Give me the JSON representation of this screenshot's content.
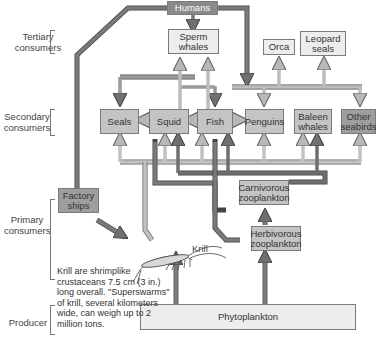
{
  "levels": {
    "tertiary": "Tertiary consumers",
    "secondary": "Secondary consumers",
    "primary": "Primary consumers",
    "producer": "Producer"
  },
  "nodes": {
    "humans": "Humans",
    "sperm_whales": "Sperm whales",
    "orca": "Orca",
    "leopard_seals": "Leopard seals",
    "seals": "Seals",
    "squid": "Squid",
    "fish": "Fish",
    "penguins": "Penguins",
    "baleen_whales": "Baleen whales",
    "other_seabirds": "Other seabirds",
    "factory_ships": "Factory ships",
    "carnivorous_zooplankton": "Carnivorous zooplankton",
    "herbivorous_zooplankton": "Herbivorous zooplankton",
    "krill": "Krill",
    "phytoplankton": "Phytoplankton"
  },
  "note": "Krill are shrimplike crustaceans 7.5 cm (3 in.) long overall. \"Superswarms\" of krill, several kilometers wide, can weigh up to 2 million tons.",
  "colors": {
    "light_arrow": "#b8b8b8",
    "dark_arrow": "#707070",
    "box_light": "#ededed",
    "box_mid": "#c4c4c4",
    "box_dark": "#9e9e9e"
  }
}
